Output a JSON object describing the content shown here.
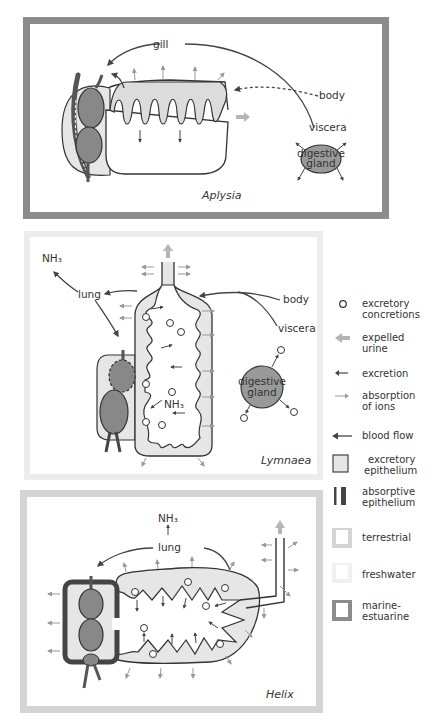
{
  "figure": {
    "panels": [
      {
        "species": "Aplysia",
        "habitat": "marine-estuarine",
        "border_color": "#8c8c8c",
        "labels": {
          "gill": "gill",
          "body": "body",
          "viscera": "viscera",
          "gland_line1": "digestive",
          "gland_line2": "gland"
        }
      },
      {
        "species": "Lymnaea",
        "habitat": "freshwater",
        "border_color": "#ececec",
        "labels": {
          "nh3_top": "NH₃",
          "lung": "lung",
          "body": "body",
          "viscera": "viscera",
          "nh3_inner": "NH₃",
          "gland_line1": "digestive",
          "gland_line2": "gland"
        }
      },
      {
        "species": "Helix",
        "habitat": "terrestrial",
        "border_color": "#d4d4d4",
        "labels": {
          "nh3": "NH₃",
          "lung": "lung"
        }
      }
    ],
    "legend": [
      {
        "symbol": "circle-outline",
        "text1": "excretory",
        "text2": "concretions"
      },
      {
        "symbol": "wide-gray-arrow",
        "text1": "expelled",
        "text2": "urine"
      },
      {
        "symbol": "small-dark-arrow",
        "text1": "excretion",
        "text2": ""
      },
      {
        "symbol": "thin-gray-arrow",
        "text1": "absorption",
        "text2": "of ions"
      },
      {
        "symbol": "long-dark-arrow",
        "text1": "blood flow",
        "text2": ""
      },
      {
        "symbol": "light-gray-box",
        "text1": "excretory",
        "text2": "epithelium"
      },
      {
        "symbol": "dark-bars",
        "text1": "absorptive",
        "text2": "epithelium"
      },
      {
        "symbol": "terrestrial-frame",
        "text1": "terrestrial",
        "text2": ""
      },
      {
        "symbol": "freshwater-frame",
        "text1": "freshwater",
        "text2": ""
      },
      {
        "symbol": "marine-frame",
        "text1": "marine-",
        "text2": "estuarine"
      }
    ],
    "colors": {
      "heart": "#888888",
      "excretory_epithelium": "#e6e6e6",
      "line": "#444444",
      "ion_arrow": "#999999",
      "urine_arrow": "#b5b5b5",
      "absorptive": "#444444"
    }
  }
}
